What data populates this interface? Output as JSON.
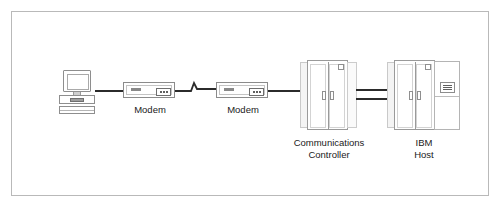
{
  "diagram": {
    "frame": {
      "border_color": "#b9b9b9"
    },
    "nodes": [
      {
        "id": "terminal",
        "icon": "terminal-workstation-icon",
        "label": "",
        "parts": [
          "monitor",
          "screen",
          "stand",
          "base-badge",
          "keyboard"
        ]
      },
      {
        "id": "modem-1",
        "icon": "modem-icon",
        "label": "Modem",
        "led_count": 3
      },
      {
        "id": "modem-2",
        "icon": "modem-icon",
        "label": "Modem",
        "led_count": 3
      },
      {
        "id": "communications-controller",
        "icon": "cabinet-icon",
        "label": "Communications\nController",
        "label_line_1": "Communications",
        "label_line_2": "Controller"
      },
      {
        "id": "ibm-host",
        "icon": "cabinet-icon",
        "label": "IBM\nHost",
        "label_line_1": "IBM",
        "label_line_2": "Host"
      }
    ],
    "links": [
      {
        "id": "terminal-to-modem-1",
        "style": "solid",
        "from": "terminal",
        "to": "modem-1"
      },
      {
        "id": "modem-1-to-modem-2",
        "style": "telephone-line-lightning",
        "from": "modem-1",
        "to": "modem-2"
      },
      {
        "id": "modem-2-to-controller",
        "style": "solid",
        "from": "modem-2",
        "to": "communications-controller"
      },
      {
        "id": "controller-to-host-channel-a",
        "style": "solid",
        "from": "communications-controller",
        "to": "ibm-host"
      },
      {
        "id": "controller-to-host-channel-b",
        "style": "solid",
        "from": "communications-controller",
        "to": "ibm-host"
      }
    ],
    "colors": {
      "line": "#2b2b2b",
      "cabinet_outline": "#9a9a9a",
      "cabinet_side": "#f4f4f4",
      "text": "#1a1a1a",
      "background": "#ffffff"
    }
  }
}
